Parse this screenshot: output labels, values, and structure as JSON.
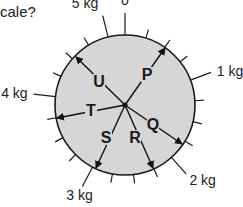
{
  "question": {
    "text": "cale?"
  },
  "dial": {
    "center": [
      125,
      105
    ],
    "radius": 70,
    "fill": "#d6d6d6",
    "stroke": "#1a1a1a",
    "scale_span_degrees": 346,
    "divisions_per_kg": 4,
    "max_kg": 5,
    "scale_labels": [
      {
        "text": "0",
        "value": 0
      },
      {
        "text": "1 kg",
        "value": 1
      },
      {
        "text": "2 kg",
        "value": 2
      },
      {
        "text": "3 kg",
        "value": 3
      },
      {
        "text": "4 kg",
        "value": 4
      },
      {
        "text": "5 kg",
        "value": 5
      }
    ]
  },
  "vectors": [
    {
      "label": "P",
      "tip": [
        165,
        48
      ],
      "label_pos": [
        147,
        80
      ]
    },
    {
      "label": "Q",
      "tip": [
        182,
        144
      ],
      "label_pos": [
        153,
        130
      ]
    },
    {
      "label": "R",
      "tip": [
        153,
        168
      ],
      "label_pos": [
        135,
        143
      ]
    },
    {
      "label": "S",
      "tip": [
        96,
        168
      ],
      "label_pos": [
        106,
        143
      ]
    },
    {
      "label": "T",
      "tip": [
        57,
        118
      ],
      "label_pos": [
        91,
        116
      ]
    },
    {
      "label": "U",
      "tip": [
        76,
        57
      ],
      "label_pos": [
        99,
        87
      ]
    }
  ]
}
